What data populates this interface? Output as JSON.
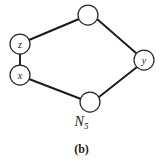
{
  "figure": {
    "graph_name": "N",
    "graph_name_subscript": "5",
    "panel_label": "(b)",
    "line_color": "#1a1a1a",
    "node_stroke_color": "#262626",
    "node_fill_color": "#ffffff",
    "background_color": "#ffffff"
  },
  "graph": {
    "nodes": [
      {
        "id": "top",
        "label": "",
        "cx": 88,
        "cy": 15,
        "r": 10
      },
      {
        "id": "z",
        "label": "z",
        "cx": 20,
        "cy": 44,
        "r": 10
      },
      {
        "id": "x",
        "label": "x",
        "cx": 20,
        "cy": 75,
        "r": 10
      },
      {
        "id": "bottom",
        "label": "",
        "cx": 90,
        "cy": 102,
        "r": 10
      },
      {
        "id": "y",
        "label": "y",
        "cx": 144,
        "cy": 60,
        "r": 10
      }
    ],
    "edges": [
      {
        "from": "z",
        "to": "top",
        "x1": 29,
        "y1": 40,
        "x2": 79,
        "y2": 19
      },
      {
        "from": "top",
        "to": "y",
        "x1": 97,
        "y1": 19,
        "x2": 136,
        "y2": 53
      },
      {
        "from": "y",
        "to": "bottom",
        "x1": 137,
        "y1": 67,
        "x2": 99,
        "y2": 97
      },
      {
        "from": "bottom",
        "to": "x",
        "x1": 81,
        "y1": 99,
        "x2": 29,
        "y2": 79
      },
      {
        "from": "x",
        "to": "z",
        "x1": 20,
        "y1": 65,
        "x2": 20,
        "y2": 54
      }
    ]
  }
}
